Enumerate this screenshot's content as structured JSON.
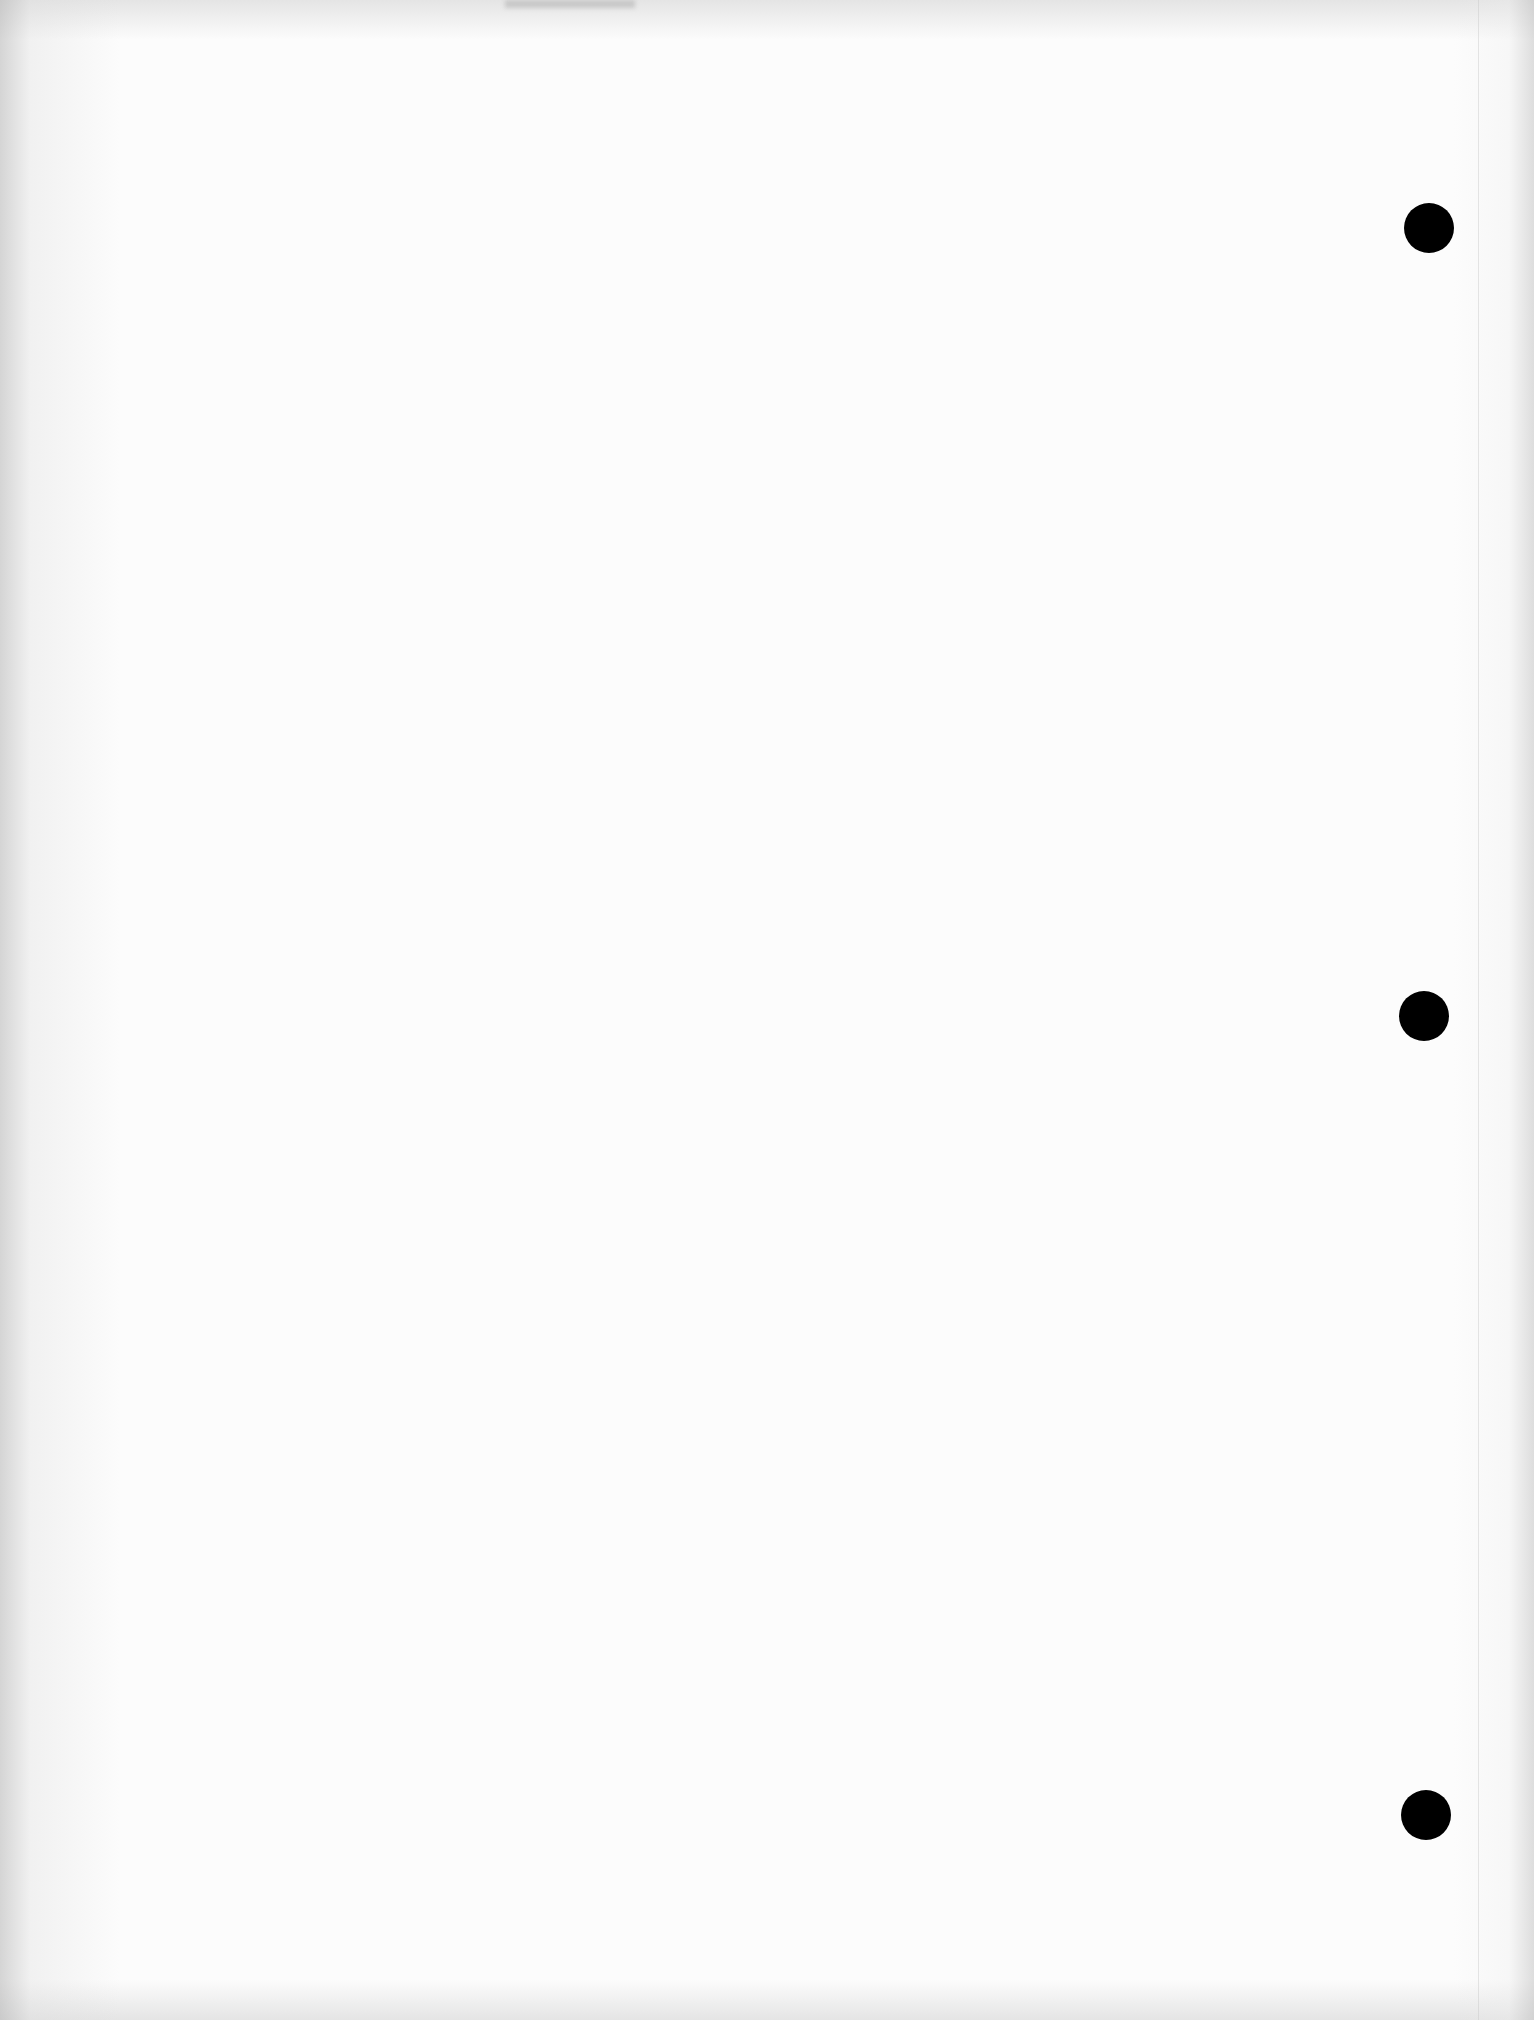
{
  "document": {
    "type": "blank scanned page",
    "text": "",
    "punch_holes": [
      {
        "x": 1429,
        "y": 228,
        "diameter": 50
      },
      {
        "x": 1424,
        "y": 1016,
        "diameter": 50
      },
      {
        "x": 1426,
        "y": 1815,
        "diameter": 50
      }
    ],
    "colors": {
      "paper": "#fcfcfc",
      "hole": "#000000"
    }
  }
}
